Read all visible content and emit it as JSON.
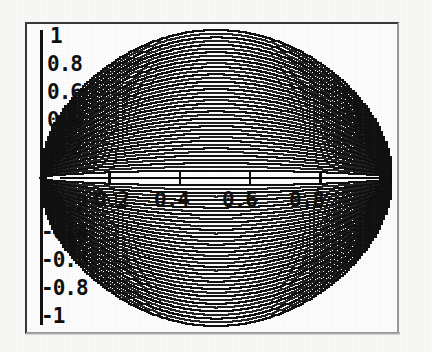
{
  "figure": {
    "title": "",
    "background_color": "#ffffff",
    "frame_color": "#4a4a4a",
    "curve_color": "#111111"
  },
  "axes": {
    "x_axis_label": "",
    "y_axis_label": "",
    "x_tick_labels": [
      "0.2",
      "0.4",
      "0.6",
      "0.8",
      "1"
    ],
    "x_tick_values": [
      0.2,
      0.4,
      0.6,
      0.8,
      1
    ],
    "y_tick_labels": [
      "1",
      "0.8",
      "0.6",
      "0.4",
      "0.2",
      "-0.2",
      "-0.4",
      "-0.6",
      "-0.8",
      "-1"
    ],
    "y_tick_values": [
      1,
      0.8,
      0.6,
      0.4,
      0.2,
      -0.2,
      -0.4,
      -0.6,
      -0.8,
      -1
    ],
    "x_range": [
      0,
      1
    ],
    "y_range": [
      -1,
      1
    ],
    "grid": false,
    "axis_style": "crossed-center-lines"
  },
  "chart_data": {
    "type": "line",
    "title": "",
    "xlabel": "",
    "ylabel": "",
    "xlim": [
      0,
      1
    ],
    "ylim": [
      -1,
      1
    ],
    "grid": false,
    "legend": "none",
    "x": [
      0,
      0.05,
      0.1,
      0.15,
      0.2,
      0.25,
      0.3,
      0.35,
      0.4,
      0.45,
      0.5,
      0.55,
      0.6,
      0.65,
      0.7,
      0.75,
      0.8,
      0.85,
      0.9,
      0.95,
      1
    ],
    "series": [
      {
        "name": "c1",
        "amplitude": 1.0,
        "values": [
          0,
          0.436,
          0.6,
          0.714,
          0.8,
          0.866,
          0.917,
          0.954,
          0.98,
          0.995,
          1.0,
          0.995,
          0.98,
          0.954,
          0.917,
          0.866,
          0.8,
          0.714,
          0.6,
          0.436,
          0
        ]
      },
      {
        "name": "c2",
        "amplitude": 0.95,
        "values": [
          0,
          0.414,
          0.57,
          0.678,
          0.76,
          0.823,
          0.871,
          0.906,
          0.931,
          0.945,
          0.95,
          0.945,
          0.931,
          0.906,
          0.871,
          0.823,
          0.76,
          0.678,
          0.57,
          0.414,
          0
        ]
      },
      {
        "name": "c3",
        "amplitude": 0.9,
        "values": [
          0,
          0.392,
          0.54,
          0.643,
          0.72,
          0.779,
          0.825,
          0.859,
          0.882,
          0.895,
          0.9,
          0.895,
          0.882,
          0.859,
          0.825,
          0.779,
          0.72,
          0.643,
          0.54,
          0.392,
          0
        ]
      },
      {
        "name": "c4",
        "amplitude": 0.85,
        "values": [
          0,
          0.371,
          0.51,
          0.607,
          0.68,
          0.736,
          0.779,
          0.811,
          0.833,
          0.846,
          0.85,
          0.846,
          0.833,
          0.811,
          0.779,
          0.736,
          0.68,
          0.607,
          0.51,
          0.371,
          0
        ]
      },
      {
        "name": "c5",
        "amplitude": 0.8,
        "values": [
          0,
          0.349,
          0.48,
          0.571,
          0.64,
          0.693,
          0.733,
          0.763,
          0.784,
          0.796,
          0.8,
          0.796,
          0.784,
          0.763,
          0.733,
          0.693,
          0.64,
          0.571,
          0.48,
          0.349,
          0
        ]
      },
      {
        "name": "c6",
        "amplitude": 0.75,
        "values": [
          0,
          0.327,
          0.45,
          0.536,
          0.6,
          0.65,
          0.687,
          0.716,
          0.735,
          0.746,
          0.75,
          0.746,
          0.735,
          0.716,
          0.687,
          0.65,
          0.6,
          0.536,
          0.45,
          0.327,
          0
        ]
      },
      {
        "name": "c7",
        "amplitude": 0.7,
        "values": [
          0,
          0.305,
          0.42,
          0.5,
          0.56,
          0.606,
          0.642,
          0.668,
          0.686,
          0.696,
          0.7,
          0.696,
          0.686,
          0.668,
          0.642,
          0.606,
          0.56,
          0.5,
          0.42,
          0.305,
          0
        ]
      },
      {
        "name": "c8",
        "amplitude": 0.65,
        "values": [
          0,
          0.283,
          0.39,
          0.464,
          0.52,
          0.563,
          0.596,
          0.62,
          0.637,
          0.647,
          0.65,
          0.647,
          0.637,
          0.62,
          0.596,
          0.563,
          0.52,
          0.464,
          0.39,
          0.283,
          0
        ]
      },
      {
        "name": "c9",
        "amplitude": 0.6,
        "values": [
          0,
          0.262,
          0.36,
          0.429,
          0.48,
          0.52,
          0.55,
          0.573,
          0.588,
          0.597,
          0.6,
          0.597,
          0.588,
          0.573,
          0.55,
          0.52,
          0.48,
          0.429,
          0.36,
          0.262,
          0
        ]
      },
      {
        "name": "c10",
        "amplitude": 0.55,
        "values": [
          0,
          0.24,
          0.33,
          0.393,
          0.44,
          0.476,
          0.504,
          0.525,
          0.539,
          0.547,
          0.55,
          0.547,
          0.539,
          0.525,
          0.504,
          0.476,
          0.44,
          0.393,
          0.33,
          0.24,
          0
        ]
      },
      {
        "name": "c11",
        "amplitude": 0.5,
        "values": [
          0,
          0.218,
          0.3,
          0.357,
          0.4,
          0.433,
          0.458,
          0.477,
          0.49,
          0.497,
          0.5,
          0.497,
          0.49,
          0.477,
          0.458,
          0.433,
          0.4,
          0.357,
          0.3,
          0.218,
          0
        ]
      },
      {
        "name": "c12",
        "amplitude": 0.45,
        "values": [
          0,
          0.196,
          0.27,
          0.321,
          0.36,
          0.39,
          0.412,
          0.429,
          0.441,
          0.448,
          0.45,
          0.448,
          0.441,
          0.429,
          0.412,
          0.39,
          0.36,
          0.321,
          0.27,
          0.196,
          0
        ]
      },
      {
        "name": "c13",
        "amplitude": 0.4,
        "values": [
          0,
          0.175,
          0.24,
          0.286,
          0.32,
          0.346,
          0.367,
          0.382,
          0.392,
          0.398,
          0.4,
          0.398,
          0.392,
          0.382,
          0.367,
          0.346,
          0.32,
          0.286,
          0.24,
          0.175,
          0
        ]
      },
      {
        "name": "c14",
        "amplitude": 0.35,
        "values": [
          0,
          0.153,
          0.21,
          0.25,
          0.28,
          0.303,
          0.321,
          0.334,
          0.343,
          0.348,
          0.35,
          0.348,
          0.343,
          0.334,
          0.321,
          0.303,
          0.28,
          0.25,
          0.21,
          0.153,
          0
        ]
      },
      {
        "name": "c15",
        "amplitude": 0.3,
        "values": [
          0,
          0.131,
          0.18,
          0.214,
          0.24,
          0.26,
          0.275,
          0.286,
          0.294,
          0.299,
          0.3,
          0.299,
          0.294,
          0.286,
          0.275,
          0.26,
          0.24,
          0.214,
          0.18,
          0.131,
          0
        ]
      },
      {
        "name": "c16",
        "amplitude": 0.25,
        "values": [
          0,
          0.109,
          0.15,
          0.179,
          0.2,
          0.217,
          0.229,
          0.239,
          0.245,
          0.249,
          0.25,
          0.249,
          0.245,
          0.239,
          0.229,
          0.217,
          0.2,
          0.179,
          0.15,
          0.109,
          0
        ]
      },
      {
        "name": "c17",
        "amplitude": 0.2,
        "values": [
          0,
          0.087,
          0.12,
          0.143,
          0.16,
          0.173,
          0.183,
          0.191,
          0.196,
          0.199,
          0.2,
          0.199,
          0.196,
          0.191,
          0.183,
          0.173,
          0.16,
          0.143,
          0.12,
          0.087,
          0
        ]
      },
      {
        "name": "c18",
        "amplitude": 0.15,
        "values": [
          0,
          0.065,
          0.09,
          0.107,
          0.12,
          0.13,
          0.138,
          0.143,
          0.147,
          0.149,
          0.15,
          0.149,
          0.147,
          0.143,
          0.138,
          0.13,
          0.12,
          0.107,
          0.09,
          0.065,
          0
        ]
      },
      {
        "name": "c19",
        "amplitude": 0.1,
        "values": [
          0,
          0.044,
          0.06,
          0.071,
          0.08,
          0.087,
          0.092,
          0.095,
          0.098,
          0.099,
          0.1,
          0.099,
          0.098,
          0.095,
          0.092,
          0.087,
          0.08,
          0.071,
          0.06,
          0.044,
          0
        ]
      },
      {
        "name": "c20",
        "amplitude": 0.05,
        "values": [
          0,
          0.022,
          0.03,
          0.036,
          0.04,
          0.043,
          0.046,
          0.048,
          0.049,
          0.05,
          0.05,
          0.05,
          0.049,
          0.048,
          0.046,
          0.043,
          0.04,
          0.036,
          0.03,
          0.022,
          0
        ]
      }
    ],
    "mirrored": true,
    "curve_count_per_half": 20
  }
}
